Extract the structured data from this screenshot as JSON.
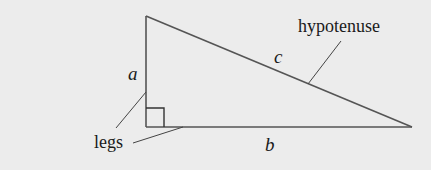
{
  "diagram": {
    "type": "right-triangle",
    "background_color": "#ececec",
    "line_color": "#555555",
    "labels": {
      "side_a": "a",
      "side_b": "b",
      "side_c": "c",
      "hypotenuse": "hypotenuse",
      "legs": "legs"
    },
    "vertices": {
      "top": [
        146,
        16
      ],
      "right_angle": [
        146,
        126
      ],
      "right": [
        412,
        127
      ]
    }
  }
}
